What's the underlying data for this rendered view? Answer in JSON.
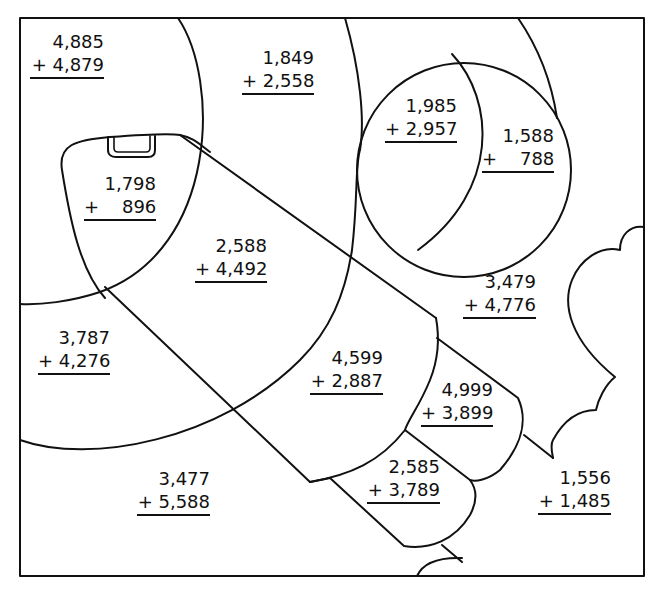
{
  "worksheet": {
    "type": "addition color-by-region puzzle",
    "line_color": "#111111",
    "background": "#ffffff",
    "problems": [
      {
        "id": "p1",
        "region": "upper-left arc",
        "top": "4,885",
        "bottom": "+ 4,879"
      },
      {
        "id": "p2",
        "region": "top sky",
        "top": "1,849",
        "bottom": "+ 2,558"
      },
      {
        "id": "p3",
        "region": "sphere left",
        "top": "1,985",
        "bottom": "+ 2,957"
      },
      {
        "id": "p4",
        "region": "sphere crescent",
        "top": "1,588",
        "bottom": "+    788"
      },
      {
        "id": "p5",
        "region": "rocket nose",
        "top": "1,798",
        "bottom": "+    896"
      },
      {
        "id": "p6",
        "region": "rocket body upper",
        "top": "2,588",
        "bottom": "+ 4,492"
      },
      {
        "id": "p7",
        "region": "right sky",
        "top": "3,479",
        "bottom": "+ 4,776"
      },
      {
        "id": "p8",
        "region": "left arc lower",
        "top": "3,787",
        "bottom": "+ 4,276"
      },
      {
        "id": "p9",
        "region": "rocket body lower",
        "top": "4,599",
        "bottom": "+ 2,887"
      },
      {
        "id": "p10",
        "region": "rocket fin upper",
        "top": "4,999",
        "bottom": "+ 3,899"
      },
      {
        "id": "p11",
        "region": "rocket fin lower",
        "top": "2,585",
        "bottom": "+ 3,789"
      },
      {
        "id": "p12",
        "region": "bottom left ground",
        "top": "3,477",
        "bottom": "+ 5,588"
      },
      {
        "id": "p13",
        "region": "bottom right ground",
        "top": "1,556",
        "bottom": "+ 1,485"
      }
    ]
  }
}
